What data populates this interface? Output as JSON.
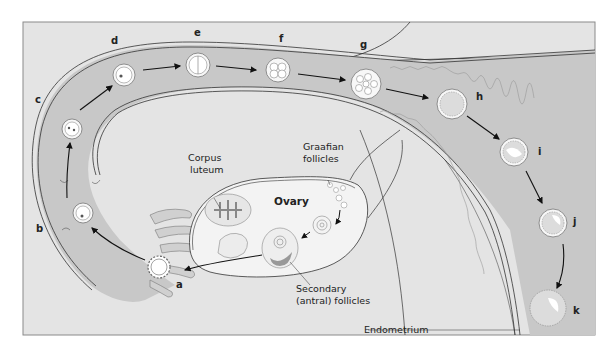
{
  "figure": {
    "colors": {
      "background": "#e4e4e4",
      "tube": "#c8c8c8",
      "tube_outline": "#333333",
      "ovary_fill": "#f3f3f3",
      "cell_fill": "#f7f7f7",
      "arrow": "#111111",
      "frame": "#8a8a8a"
    },
    "stage_labels": {
      "a": "a",
      "b": "b",
      "c": "c",
      "d": "d",
      "e": "e",
      "f": "f",
      "g": "g",
      "h": "h",
      "i": "i",
      "j": "j",
      "k": "k"
    },
    "structure_labels": {
      "ovary": "Ovary",
      "corpus_luteum_line1": "Corpus",
      "corpus_luteum_line2": "luteum",
      "graafian_line1": "Graafian",
      "graafian_line2": "follicles",
      "secondary_line1": "Secondary",
      "secondary_line2": "(antral) follicles",
      "endometrium": "Endometrium"
    }
  }
}
